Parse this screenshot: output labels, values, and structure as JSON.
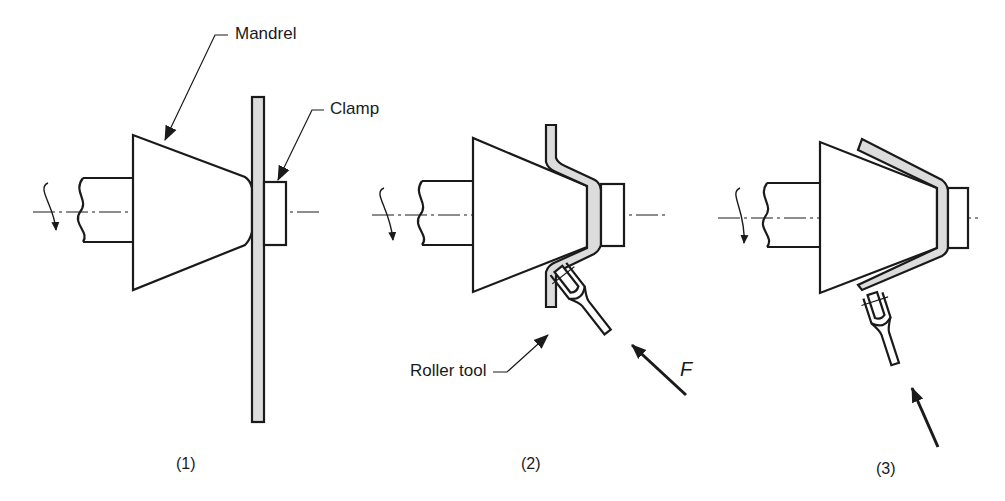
{
  "figure": {
    "labels": {
      "mandrel": "Mandrel",
      "clamp": "Clamp",
      "roller_tool": "Roller tool",
      "force": "F"
    },
    "steps": [
      {
        "id": 1,
        "caption": "(1)"
      },
      {
        "id": 2,
        "caption": "(2)"
      },
      {
        "id": 3,
        "caption": "(3)"
      }
    ],
    "colors": {
      "line": "#1a1a1a",
      "workpiece_fill": "#dcdcdc",
      "background": "#ffffff"
    }
  }
}
